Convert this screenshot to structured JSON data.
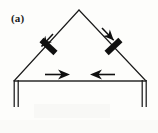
{
  "figure": {
    "panel_label": "(a)",
    "type": "schematic-diagram",
    "background_color": "#fdfdfb",
    "ink_color": "#1a1a1a",
    "geometry": {
      "apex": {
        "x": 79,
        "y": 10
      },
      "base_left": {
        "x": 14,
        "y": 81
      },
      "base_right": {
        "x": 146,
        "y": 81
      },
      "support_depth_px": 26
    },
    "members": [
      {
        "name": "left-inclined-member",
        "from": "base_left",
        "to": "apex",
        "stroke_width": 1.1
      },
      {
        "name": "right-inclined-member",
        "from": "apex",
        "to": "base_right",
        "stroke_width": 1.1
      },
      {
        "name": "bottom-tie-member",
        "from": "base_left",
        "to": "base_right",
        "stroke_width": 1.6
      }
    ],
    "force_arrows": [
      {
        "name": "left-member-force-arrow",
        "direction": "down-left",
        "along": "left-inclined-member",
        "pointing": "away-from-apex"
      },
      {
        "name": "right-member-force-arrow",
        "direction": "up-right",
        "along": "right-inclined-member",
        "pointing": "toward-apex"
      },
      {
        "name": "bottom-left-force-arrow",
        "direction": "right",
        "along": "bottom-tie-member",
        "pointing": "inward"
      },
      {
        "name": "bottom-right-force-arrow",
        "direction": "left",
        "along": "bottom-tie-member",
        "pointing": "inward"
      }
    ],
    "hatch_marks": [
      {
        "name": "left-member-hatch-mark",
        "on": "left-inclined-member",
        "orientation": "perpendicular",
        "position_fraction": 0.52
      },
      {
        "name": "right-member-hatch-mark",
        "on": "right-inclined-member",
        "orientation": "perpendicular",
        "position_fraction": 0.52
      }
    ],
    "supports": [
      {
        "name": "left-support",
        "at": "base_left",
        "style": "double-vertical-line"
      },
      {
        "name": "right-support",
        "at": "base_right",
        "style": "double-vertical-line"
      }
    ]
  }
}
